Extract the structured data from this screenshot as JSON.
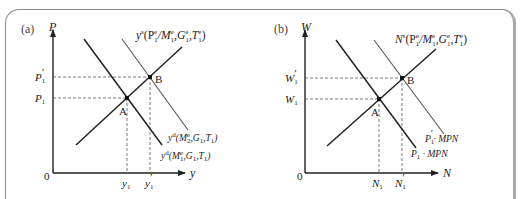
{
  "figure": {
    "panels": [
      {
        "tag": "(a)",
        "y_axis": {
          "label": "P"
        },
        "x_axis": {
          "label": "y"
        },
        "origin": "0",
        "y_ticks": [
          {
            "base": "P",
            "sub": "1",
            "prime": "′"
          },
          {
            "base": "P",
            "sub": "1",
            "prime": ""
          }
        ],
        "x_ticks": [
          {
            "base": "y",
            "sub": "1",
            "prime": ""
          },
          {
            "base": "y",
            "sub": "1",
            "prime": "′"
          }
        ],
        "points": {
          "a": "A",
          "b": "B"
        },
        "supply_label": {
          "base": "y",
          "sup": "s",
          "args": "(P",
          "a1_sup": "e",
          "a1_sub": "1",
          "a2": "/M",
          "a2_sup": "e",
          "a2_sub": "1",
          "a3": ",G",
          "a3_sup": "e",
          "a3_sub": "1",
          "a4": ",T",
          "a4_sup": "e",
          "a4_sub": "1",
          "close": ")"
        },
        "demand_labels": [
          {
            "base": "y",
            "sup": "d",
            "text": "(M",
            "m_sup": "e",
            "m_sub": "2",
            "rest": ",G",
            "g_sub": "1",
            "t": ",T",
            "t_sub": "1",
            "close": ")"
          },
          {
            "base": "y",
            "sup": "d",
            "text": "(M",
            "m_sup": "e",
            "m_sub": "1",
            "rest": ",G",
            "g_sub": "1",
            "t": ",T",
            "t_sub": "1",
            "close": ")"
          }
        ]
      },
      {
        "tag": "(b)",
        "y_axis": {
          "label": "W"
        },
        "x_axis": {
          "label": "N"
        },
        "origin": "0",
        "y_ticks": [
          {
            "base": "W",
            "sub": "1",
            "prime": "′"
          },
          {
            "base": "W",
            "sub": "1",
            "prime": ""
          }
        ],
        "x_ticks": [
          {
            "base": "N",
            "sub": "1",
            "prime": ""
          },
          {
            "base": "N",
            "sub": "1",
            "prime": "′"
          }
        ],
        "points": {
          "a": "A",
          "b": "B"
        },
        "supply_label": {
          "base": "N",
          "sup": "s",
          "args": "(P",
          "a1_sup": "e",
          "a1_sub": "1",
          "a2": "/M",
          "a2_sup": "e",
          "a2_sub": "1",
          "a3": ",G",
          "a3_sup": "e",
          "a3_sub": "1",
          "a4": ",T",
          "a4_sup": "e",
          "a4_sub": "1",
          "close": ")"
        },
        "demand_labels": [
          {
            "base": "P",
            "sub": "1",
            "prime": "′",
            "rest": "· MPN"
          },
          {
            "base": "P",
            "sub": "1",
            "prime": "",
            "rest": " · MPN"
          }
        ]
      }
    ]
  }
}
